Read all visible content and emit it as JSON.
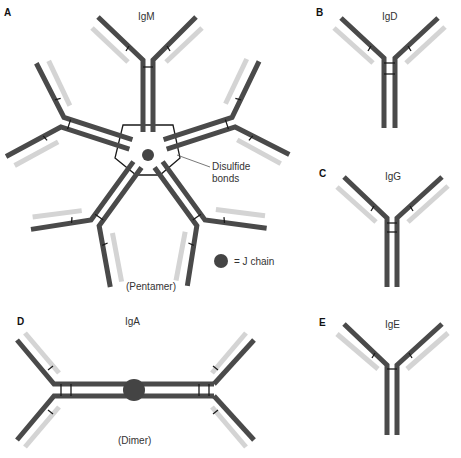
{
  "figure": {
    "colors": {
      "heavy_chain": "#4a4a4a",
      "light_chain": "#d4d4d4",
      "disulfide_bond": "#1a1a1a",
      "j_chain": "#444444",
      "background": "#ffffff"
    }
  },
  "panels": {
    "A": {
      "letter": "A",
      "name": "IgM",
      "form": "(Pentamer)",
      "annotation_bonds_line1": "Disulfide",
      "annotation_bonds_line2": "bonds",
      "legend_jchain": "= J chain"
    },
    "B": {
      "letter": "B",
      "name": "IgD"
    },
    "C": {
      "letter": "C",
      "name": "IgG"
    },
    "D": {
      "letter": "D",
      "name": "IgA",
      "form": "(Dimer)"
    },
    "E": {
      "letter": "E",
      "name": "IgE"
    }
  }
}
